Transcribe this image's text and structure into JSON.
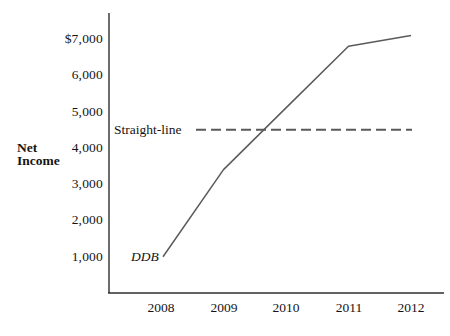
{
  "chart_data": {
    "type": "line",
    "title": "",
    "xlabel": "",
    "ylabel": "Net Income",
    "categories": [
      "2008",
      "2009",
      "2010",
      "2011",
      "2012"
    ],
    "ytick_labels": [
      "$7,000",
      "6,000",
      "5,000",
      "4,000",
      "3,000",
      "2,000",
      "1,000"
    ],
    "ytick_values": [
      7000,
      6000,
      5000,
      4000,
      3000,
      2000,
      1000
    ],
    "ylim": [
      0,
      7700
    ],
    "grid": false,
    "legend_position": "inline-annotations",
    "series": [
      {
        "name": "DDB",
        "style": "solid",
        "values": [
          1000,
          3400,
          5100,
          6800,
          7100
        ]
      },
      {
        "name": "Straight-line",
        "style": "dashed",
        "values": [
          4500,
          4500,
          4500,
          4500,
          4500
        ]
      }
    ],
    "annotations": [
      {
        "text": "DDB",
        "attached_to": "DDB series start"
      },
      {
        "text": "Straight-line",
        "attached_to": "dashed line left end"
      }
    ],
    "colors": {
      "line": "#5a5a5a",
      "axis": "#2e2e2e",
      "text": "#141414",
      "background": "#ffffff"
    }
  }
}
